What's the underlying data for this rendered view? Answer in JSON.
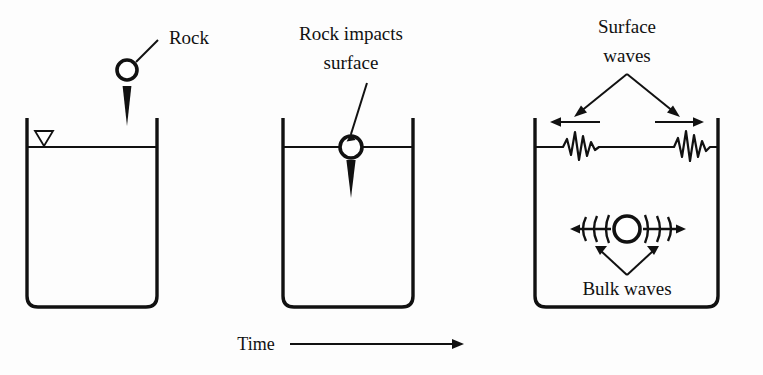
{
  "figure": {
    "background_color": "#fdfdfd",
    "ink_color": "#111111"
  },
  "labels": {
    "rock": "Rock",
    "rock_impacts_line1": "Rock impacts",
    "rock_impacts_line2": "surface",
    "surface_waves_line1": "Surface",
    "surface_waves_line2": "waves",
    "bulk_waves": "Bulk waves",
    "time": "Time"
  },
  "panels": [
    {
      "name": "panel-before-impact",
      "index": 1,
      "caption": "Rock",
      "vessel": {
        "left": 27,
        "right": 157,
        "top": 118,
        "bottom": 307,
        "corner_radius": 11
      },
      "water_level_y": 147,
      "water_level_marker": "hollow-down-triangle",
      "rock": {
        "cx": 127,
        "cy": 70,
        "r": 10,
        "state": "falling"
      },
      "motion_arrow": {
        "direction": "down",
        "from_y": 84,
        "to_y": 124
      }
    },
    {
      "name": "panel-impact",
      "index": 2,
      "caption": "Rock impacts surface",
      "vessel": {
        "left": 283,
        "right": 413,
        "top": 118,
        "bottom": 307,
        "corner_radius": 11
      },
      "water_level_y": 147,
      "rock": {
        "cx": 351,
        "cy": 147,
        "r": 11,
        "state": "at-surface"
      },
      "motion_arrow": {
        "direction": "down",
        "from_y": 160,
        "to_y": 196
      }
    },
    {
      "name": "panel-waves",
      "index": 3,
      "caption": "Surface waves and Bulk waves",
      "vessel": {
        "left": 535,
        "right": 718,
        "top": 118,
        "bottom": 307,
        "corner_radius": 11
      },
      "water_level_y": 147,
      "surface_wave_packets": [
        {
          "side": "left",
          "center_x": 578,
          "direction": "left"
        },
        {
          "side": "right",
          "center_x": 690,
          "direction": "right"
        }
      ],
      "direction_arrows": [
        {
          "side": "left",
          "direction": "left",
          "y": 122
        },
        {
          "side": "right",
          "direction": "right",
          "y": 122
        }
      ],
      "bulk_source": {
        "cx": 627,
        "cy": 229,
        "r": 13
      },
      "bulk_arcs_per_side": 3,
      "bulk_arrows": [
        {
          "direction": "left",
          "tip_x": 576
        },
        {
          "direction": "right",
          "tip_x": 679
        }
      ]
    }
  ],
  "time_axis": {
    "label": "Time",
    "arrow_direction": "right",
    "arrow_from_x": 290,
    "arrow_to_x": 463,
    "y": 344
  }
}
